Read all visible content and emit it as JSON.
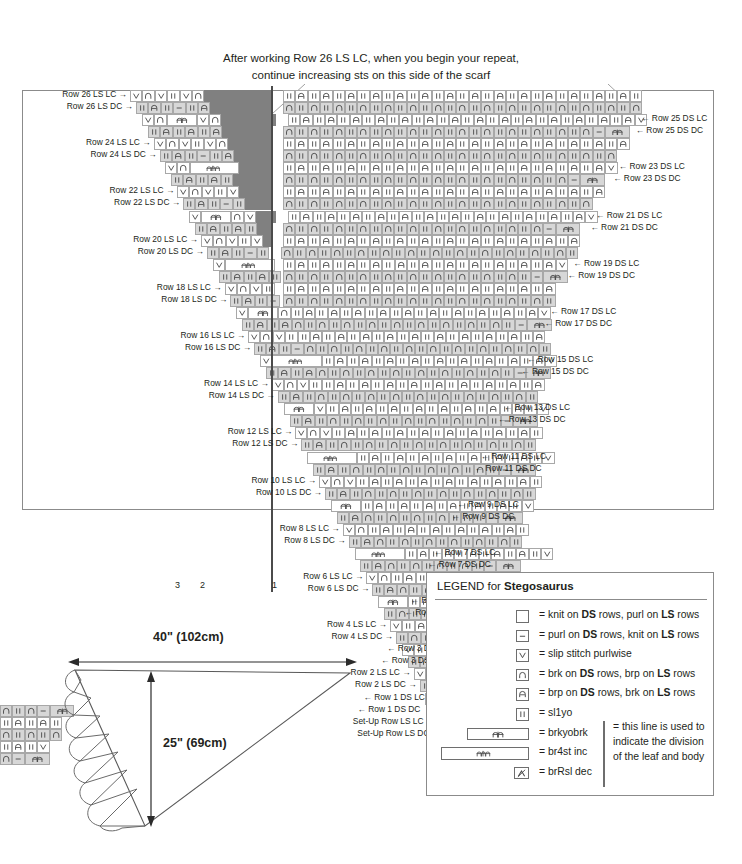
{
  "annotation": {
    "line1": "After working Row 26 LS LC, when you begin your repeat,",
    "line2": "continue increasing sts on this side of the scarf"
  },
  "chart": {
    "left_labels": [
      "Row 26 LS LC →",
      "Row 26 LS DC →",
      "Row 24 LS LC →",
      "Row 24 LS DC →",
      "Row 22 LS LC →",
      "Row 22 LS DC →",
      "Row 20 LS LC →",
      "Row 20 LS DC →",
      "Row 18 LS LC →",
      "Row 18 LS DC →",
      "Row 16 LS LC →",
      "Row 16 LS DC →",
      "Row 14 LS LC →",
      "Row 14 LS DC →",
      "Row 12 LS LC →",
      "Row 12 LS DC →",
      "Row 10 LS LC →",
      "Row 10 LS DC →",
      "Row 8 LS LC →",
      "Row 8 LS DC →",
      "Row 6 LS LC →",
      "Row 6 LS DC →",
      "Row 4 LS LC →",
      "Row 4 LS DC →",
      "Row 2 LS LC →",
      "Row 2 LS DC →",
      "Set-Up Row LS LC →",
      "Set-Up Row LS DC →"
    ],
    "right_labels": [
      "← Row 25 DS LC",
      "← Row 25 DS DC",
      "← Row 23 DS LC",
      "← Row 23 DS DC",
      "← Row 21 DS LC",
      "← Row 21 DS DC",
      "← Row 19 DS LC",
      "← Row 19 DS DC",
      "← Row 17 DS LC",
      "← Row 17 DS DC",
      "← Row 15 DS LC",
      "← Row 15 DS DC",
      "← Row 13 DS LC",
      "← Row 13 DS DC",
      "← Row 11 DS LC",
      "← Row 11 DS DC",
      "← Row 9 DS LC",
      "← Row 9 DS DC",
      "← Row 7 DS LC",
      "← Row 7 DS DC",
      "← Row 5 DS LC",
      "← Row 5 DS DC",
      "← Row 3 DS LC",
      "← Row 3 DS DC",
      "← Row 1 DS LC",
      "← Row 1 DS DC"
    ],
    "column_numbers": [
      "3",
      "2",
      "1"
    ]
  },
  "legend": {
    "title_prefix": "LEGEND for ",
    "title_name": "Stegosaurus",
    "entries": [
      {
        "symbol": "knit",
        "text": "= knit on DS rows, purl on LS rows"
      },
      {
        "symbol": "purl",
        "text": "= purl on DS rows, knit on LS rows"
      },
      {
        "symbol": "slip",
        "text": "= slip stitch purlwise"
      },
      {
        "symbol": "brk",
        "text": "= brk on DS rows, brp on LS rows"
      },
      {
        "symbol": "brp",
        "text": "= brp on DS rows, brk on LS rows"
      },
      {
        "symbol": "sl1yo",
        "text": "= sl1yo"
      },
      {
        "symbol": "brkyobrk",
        "text": "= brkyobrk"
      },
      {
        "symbol": "br4st",
        "text": "= br4st inc"
      },
      {
        "symbol": "brRsl",
        "text": "= brRsl dec"
      }
    ],
    "note": "= this line is used to indicate the division of the leaf and body"
  },
  "schematic": {
    "width_label": "40\" (102cm)",
    "height_label": "25\" (69cm)"
  },
  "chart_data": {
    "type": "table",
    "symbols": [
      "knit",
      "purl",
      "slip",
      "brk",
      "brp",
      "sl1yo",
      "brkyobrk",
      "br4st",
      "brRsl",
      "no-stitch"
    ],
    "row_count": 56,
    "column_max": 36
  }
}
